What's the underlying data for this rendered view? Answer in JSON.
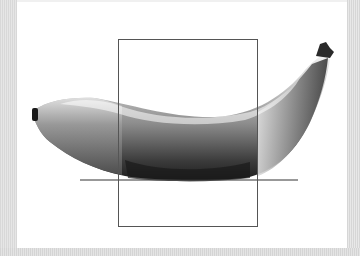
{
  "image": {
    "subject": "banana",
    "style": "grayscale photograph",
    "width": 360,
    "height": 256
  },
  "overlay": {
    "rectangle": {
      "x": 118,
      "y": 39,
      "width": 139,
      "height": 187,
      "color": "#555555"
    },
    "ground_line": {
      "x1": 80,
      "y1": 180,
      "x2": 298,
      "y2": 180,
      "color": "#333333"
    }
  },
  "colors": {
    "background": "#ffffff",
    "border": "#dddddd",
    "banana_light": "#d8d8d8",
    "banana_mid": "#8a8a8a",
    "banana_dark": "#2a2a2a"
  }
}
